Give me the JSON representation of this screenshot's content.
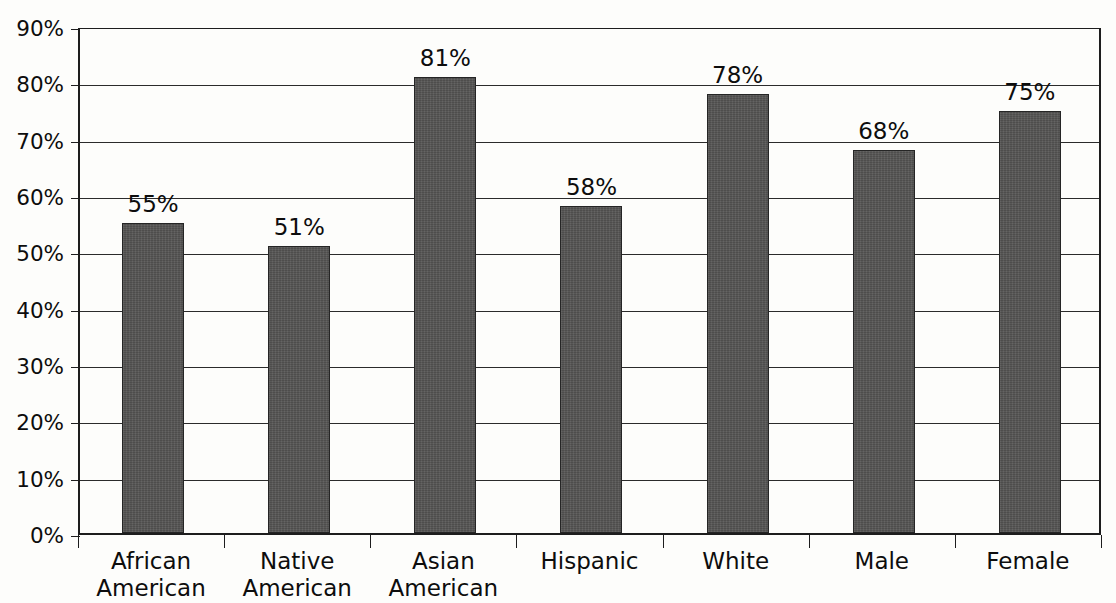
{
  "chart_data": {
    "type": "bar",
    "title": "",
    "subtitle": "",
    "xlabel": "",
    "ylabel": "",
    "categories": [
      "African\nAmerican",
      "Native\nAmerican",
      "Asian\nAmerican",
      "Hispanic",
      "White",
      "Male",
      "Female"
    ],
    "values": [
      55,
      51,
      81,
      58,
      78,
      68,
      75
    ],
    "data_labels": [
      "55%",
      "51%",
      "81%",
      "58%",
      "78%",
      "68%",
      "75%"
    ],
    "ylim": [
      0,
      90
    ],
    "ytick_values": [
      0,
      10,
      20,
      30,
      40,
      50,
      60,
      70,
      80,
      90
    ],
    "ytick_labels": [
      "0%",
      "10%",
      "20%",
      "30%",
      "40%",
      "50%",
      "60%",
      "70%",
      "80%",
      "90%"
    ],
    "grid": true,
    "legend": "none",
    "bar_color": "#555453",
    "bar_edge_color": "#252525",
    "axis_color": "#1d1d1d",
    "gridline_color": "#2b2b2b",
    "background_color": "#fdfdfb",
    "text_color": "#0d0d0d"
  }
}
